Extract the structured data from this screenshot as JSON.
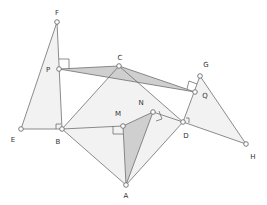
{
  "diagram": {
    "colors": {
      "stroke": "#6e6e6e",
      "light_fill": "#f2f2f2",
      "dark_fill": "#cfcfcf",
      "point_fill": "#ffffff",
      "label": "#333333"
    },
    "points": [
      {
        "name": "F",
        "x": 57,
        "y": 22,
        "lx": 57,
        "ly": 13
      },
      {
        "name": "P",
        "x": 59,
        "y": 69,
        "lx": 48,
        "ly": 72
      },
      {
        "name": "C",
        "x": 119,
        "y": 66,
        "lx": 120,
        "ly": 58
      },
      {
        "name": "G",
        "x": 200,
        "y": 76,
        "lx": 206,
        "ly": 66
      },
      {
        "name": "Q",
        "x": 195,
        "y": 92,
        "lx": 205,
        "ly": 97
      },
      {
        "name": "E",
        "x": 21,
        "y": 129,
        "lx": 13,
        "ly": 141
      },
      {
        "name": "B",
        "x": 62,
        "y": 129,
        "lx": 58,
        "ly": 143
      },
      {
        "name": "M",
        "x": 123,
        "y": 126,
        "lx": 118,
        "ly": 114
      },
      {
        "name": "N",
        "x": 153,
        "y": 112,
        "lx": 141,
        "ly": 103
      },
      {
        "name": "D",
        "x": 183,
        "y": 122,
        "lx": 186,
        "ly": 136
      },
      {
        "name": "H",
        "x": 246,
        "y": 144,
        "lx": 253,
        "ly": 157
      },
      {
        "name": "A",
        "x": 126,
        "y": 185,
        "lx": 126,
        "ly": 197
      }
    ]
  }
}
